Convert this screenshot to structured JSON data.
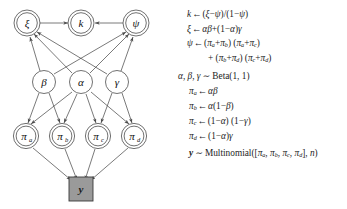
{
  "figure": {
    "type": "bayesian-network-diagram-with-equations",
    "graph": {
      "nodes": [
        {
          "id": "xi",
          "label": "ξ",
          "sub": "",
          "shape": "double-circle",
          "x": 27,
          "y": 23
        },
        {
          "id": "k",
          "label": "k",
          "sub": "",
          "shape": "double-circle",
          "x": 81,
          "y": 23
        },
        {
          "id": "psi",
          "label": "ψ",
          "sub": "",
          "shape": "double-circle",
          "x": 136,
          "y": 23
        },
        {
          "id": "beta",
          "label": "β",
          "sub": "",
          "shape": "circle",
          "x": 44,
          "y": 82
        },
        {
          "id": "alpha",
          "label": "α",
          "sub": "",
          "shape": "circle",
          "x": 81,
          "y": 82
        },
        {
          "id": "gamma",
          "label": "γ",
          "sub": "",
          "shape": "circle",
          "x": 117,
          "y": 82
        },
        {
          "id": "pi_a",
          "label": "π",
          "sub": "a",
          "shape": "double-circle",
          "x": 26,
          "y": 136
        },
        {
          "id": "pi_b",
          "label": "π",
          "sub": "b",
          "shape": "double-circle",
          "x": 62,
          "y": 136
        },
        {
          "id": "pi_c",
          "label": "π",
          "sub": "c",
          "shape": "double-circle",
          "x": 98,
          "y": 136
        },
        {
          "id": "pi_d",
          "label": "π",
          "sub": "d",
          "shape": "double-circle",
          "x": 134,
          "y": 136
        },
        {
          "id": "y",
          "label": "y",
          "sub": "",
          "shape": "filled-square",
          "x": 81,
          "y": 189
        }
      ],
      "edges": [
        {
          "from": "xi",
          "to": "k"
        },
        {
          "from": "psi",
          "to": "k"
        },
        {
          "from": "beta",
          "to": "xi"
        },
        {
          "from": "beta",
          "to": "psi"
        },
        {
          "from": "alpha",
          "to": "xi"
        },
        {
          "from": "alpha",
          "to": "psi"
        },
        {
          "from": "gamma",
          "to": "xi"
        },
        {
          "from": "gamma",
          "to": "psi"
        },
        {
          "from": "beta",
          "to": "pi_a"
        },
        {
          "from": "beta",
          "to": "pi_b"
        },
        {
          "from": "alpha",
          "to": "pi_a"
        },
        {
          "from": "alpha",
          "to": "pi_b"
        },
        {
          "from": "alpha",
          "to": "pi_c"
        },
        {
          "from": "alpha",
          "to": "pi_d"
        },
        {
          "from": "gamma",
          "to": "pi_c"
        },
        {
          "from": "gamma",
          "to": "pi_d"
        },
        {
          "from": "pi_a",
          "to": "y"
        },
        {
          "from": "pi_b",
          "to": "y"
        },
        {
          "from": "pi_c",
          "to": "y"
        },
        {
          "from": "pi_d",
          "to": "y"
        }
      ],
      "colors": {
        "stroke": "#4d4d4d",
        "node_fill": "#ffffff",
        "observed_fill": "#9a9a9a",
        "observed_stroke": "#3a3a3a"
      }
    },
    "equations": [
      {
        "id": "eq-k",
        "text": "k ← (ξ−ψ)/(1−ψ)"
      },
      {
        "id": "eq-xi",
        "text": "ξ ← αβ+(1−α)γ"
      },
      {
        "id": "eq-psi-1",
        "text": "ψ ← (πa+πb) (πa+πc)"
      },
      {
        "id": "eq-psi-2",
        "text": "+ (πb+πd) (πc+πd)"
      },
      {
        "id": "eq-prior",
        "text": "α, β, γ ~ Beta(1, 1)"
      },
      {
        "id": "eq-pi-a",
        "text": "πa ← αβ"
      },
      {
        "id": "eq-pi-b",
        "text": "πb ← α(1−β)"
      },
      {
        "id": "eq-pi-c",
        "text": "πc ← (1−α) (1−γ)"
      },
      {
        "id": "eq-pi-d",
        "text": "πd ← (1−α)γ"
      },
      {
        "id": "eq-y",
        "text": "y ~ Multinomial([πa, πb, πc, πd], n)"
      }
    ],
    "equation_tokens": {
      "arrow": "←",
      "tilde": "~",
      "beta_dist": "Beta",
      "beta_args": "(1, 1)",
      "multinomial": "Multinomial",
      "sample_size": "n"
    }
  }
}
